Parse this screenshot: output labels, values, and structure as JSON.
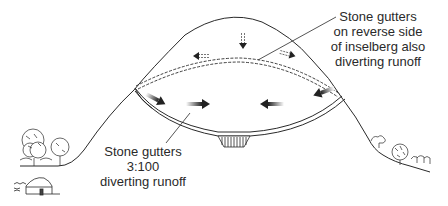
{
  "diagram": {
    "subject": "inselberg",
    "labels": {
      "reverse_side": {
        "lines": [
          "Stone gutters",
          "on reverse side",
          "of inselberg also",
          "diverting runoff"
        ]
      },
      "front_gutters": {
        "lines": [
          "Stone gutters",
          "3:100",
          "diverting runoff"
        ]
      }
    },
    "elements": {
      "hill-outline": "inselberg profile",
      "front-gutter": "stone gutter (solid double line) with arrows converging to center",
      "reverse-gutter": "stone gutter (dashed double line) on reverse side",
      "catchment": "hatched collection pit at center of gutter",
      "left-trees": "trees at left foot of hill",
      "hut": "round thatched hut",
      "right-shrubs": "shrubs at right foot of hill"
    },
    "colors": {
      "line": "#2a2a2a",
      "arrow": "#333333",
      "background": "#ffffff"
    }
  }
}
